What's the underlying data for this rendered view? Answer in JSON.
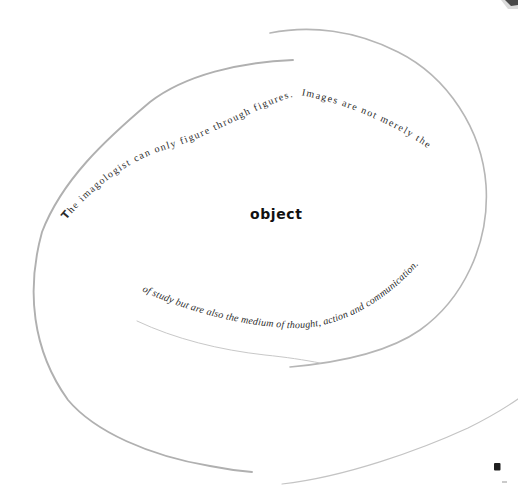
{
  "page": {
    "quote": {
      "upper_initial": "T",
      "upper_rest": "he imagologist can only figure through figures.  Images are not merely the",
      "center_word": "object",
      "lower": "of study but are also the medium of thought, action and communication."
    },
    "colors": {
      "outer_arc": "#b0b0b0",
      "second_arc": "#b6b6b6",
      "bottom_arc": "#c4c4c4",
      "inner_arc": "#c8c8c8",
      "quote_text": "#2b2b2b",
      "center_word_color": "#111111",
      "corner_mark": "#3a3a3a",
      "print_mark": "#1e1e1e",
      "print_mark_faint": "#a0a0a0"
    }
  }
}
